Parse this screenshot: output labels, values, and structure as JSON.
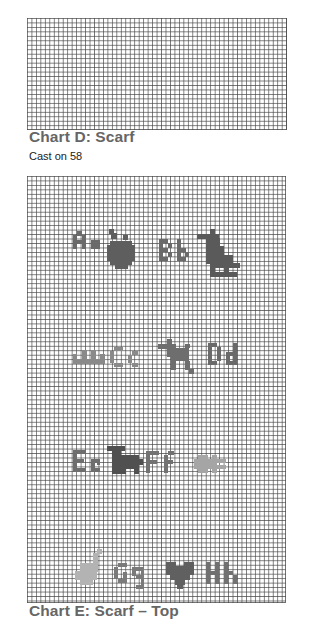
{
  "charts": [
    {
      "id": "D",
      "title": "Chart D: Scarf",
      "subtitle": "Cast on 58",
      "grid": {
        "columns": 58,
        "rows": 25
      }
    },
    {
      "id": "E",
      "title": "Chart E: Scarf – Top",
      "grid": {
        "columns": 58,
        "rows": 95
      },
      "motif_rows": [
        [
          {
            "letters": "Aa",
            "icon": "apple-icon"
          },
          {
            "letters": "Bb",
            "icon": "bird-icon"
          }
        ],
        [
          {
            "letters": "Cc",
            "icon": "crown-icon"
          },
          {
            "letters": "Dd",
            "icon": "dog-icon"
          }
        ],
        [
          {
            "letters": "Ee",
            "icon": "elephant-icon"
          },
          {
            "letters": "Ff",
            "icon": "fish-icon"
          }
        ],
        [
          {
            "letters": "Gg",
            "icon": "guitar-icon"
          },
          {
            "letters": "Hh",
            "icon": "heart-icon"
          }
        ]
      ]
    }
  ],
  "colors": {
    "grid_line": "#464646",
    "caption": "#666666",
    "motif_dark": "#5a5a5a",
    "motif_mid": "#7a7a7a",
    "motif_light": "#a8a8a8"
  }
}
